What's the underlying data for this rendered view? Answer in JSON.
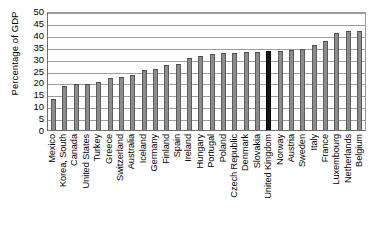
{
  "chart_data": {
    "type": "bar",
    "title": "",
    "xlabel": "",
    "ylabel": "Percentage of GDP",
    "ylim": [
      0,
      50
    ],
    "yticks": [
      0,
      5,
      10,
      15,
      20,
      25,
      30,
      35,
      40,
      45,
      50
    ],
    "grid": true,
    "legend": false,
    "highlight_category": "United Kingdom",
    "highlight_color": "#1a1313",
    "bar_color": "#8c8c8c",
    "categories": [
      "Mexico",
      "Korea, South",
      "Canada",
      "United States",
      "Turkey",
      "Greece",
      "Switzerland",
      "Australia",
      "Iceland",
      "Germany",
      "Finland",
      "Spain",
      "Ireland",
      "Hungary",
      "Portugal",
      "Poland",
      "Czech Republic",
      "Denmark",
      "Slovakia",
      "United Kingdom",
      "Norway",
      "Austria",
      "Sweden",
      "Italy",
      "France",
      "Luxembourg",
      "Netherlands",
      "Belgium"
    ],
    "values": [
      13,
      18.7,
      19.2,
      19.5,
      20.3,
      21.8,
      22.2,
      23,
      25.4,
      25.7,
      27.3,
      27.8,
      30.1,
      31,
      31.8,
      32.2,
      32.4,
      32.6,
      32.8,
      33,
      33.3,
      33.5,
      34.2,
      35.6,
      37.5,
      40.6,
      41.5,
      41.5
    ]
  }
}
